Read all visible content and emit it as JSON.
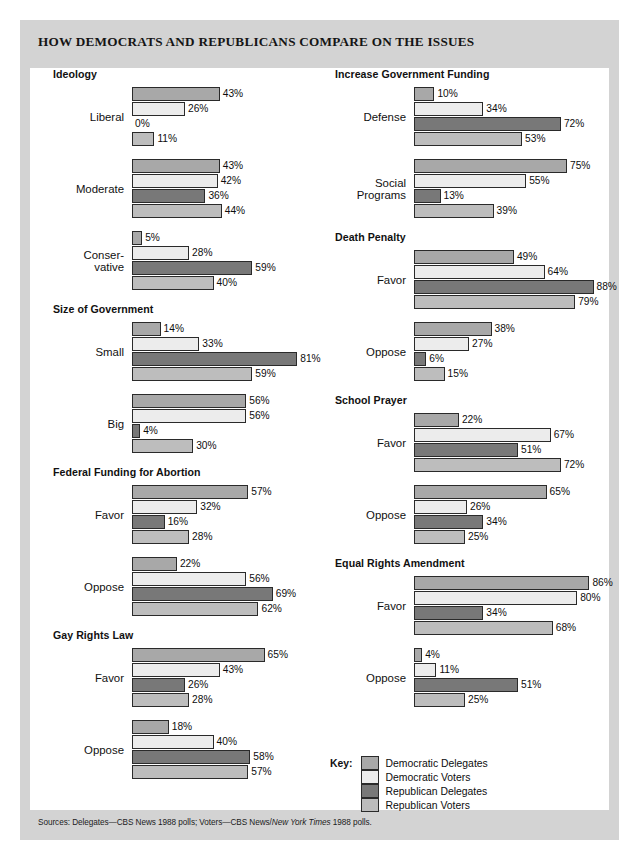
{
  "title": "HOW DEMOCRATS AND REPUBLICANS COMPARE ON THE ISSUES",
  "source_prefix": "Sources: Delegates—CBS News 1988 polls; Voters—CBS News/",
  "source_italic": "New York Times",
  "source_suffix": " 1988 polls.",
  "legend": {
    "title": "Key:",
    "entries": [
      {
        "label": "Democratic Delegates",
        "color": "#a8a8a8"
      },
      {
        "label": "Democratic Voters",
        "color": "#ececec"
      },
      {
        "label": "Republican Delegates",
        "color": "#787878"
      },
      {
        "label": "Republican Voters",
        "color": "#bdbdbd"
      }
    ]
  },
  "chart_data": {
    "type": "bar",
    "orientation": "horizontal",
    "title": "HOW DEMOCRATS AND REPUBLICANS COMPARE ON THE ISSUES",
    "xlabel": "",
    "ylabel": "",
    "xlim": [
      0,
      100
    ],
    "unit": "%",
    "grid": false,
    "legend_position": "bottom-right",
    "series_names": [
      "Democratic Delegates",
      "Democratic Voters",
      "Republican Delegates",
      "Republican Voters"
    ],
    "series_colors": [
      "#a8a8a8",
      "#ececec",
      "#787878",
      "#bdbdbd"
    ],
    "sections": [
      {
        "title": "Ideology",
        "column": "left",
        "groups": [
          {
            "label": "Liberal",
            "values": [
              43,
              26,
              0,
              11
            ]
          },
          {
            "label": "Moderate",
            "values": [
              43,
              42,
              36,
              44
            ]
          },
          {
            "label": "Conser-\nvative",
            "values": [
              5,
              28,
              59,
              40
            ]
          }
        ]
      },
      {
        "title": "Size of Government",
        "column": "left",
        "groups": [
          {
            "label": "Small",
            "values": [
              14,
              33,
              81,
              59
            ]
          },
          {
            "label": "Big",
            "values": [
              56,
              56,
              4,
              30
            ]
          }
        ]
      },
      {
        "title": "Federal Funding for Abortion",
        "column": "left",
        "groups": [
          {
            "label": "Favor",
            "values": [
              57,
              32,
              16,
              28
            ]
          },
          {
            "label": "Oppose",
            "values": [
              22,
              56,
              69,
              62
            ]
          }
        ]
      },
      {
        "title": "Gay Rights Law",
        "column": "left",
        "groups": [
          {
            "label": "Favor",
            "values": [
              65,
              43,
              26,
              28
            ]
          },
          {
            "label": "Oppose",
            "values": [
              18,
              40,
              58,
              57
            ]
          }
        ]
      },
      {
        "title": "Increase Government Funding",
        "column": "right",
        "groups": [
          {
            "label": "Defense",
            "values": [
              10,
              34,
              72,
              53
            ]
          },
          {
            "label": "Social\nPrograms",
            "values": [
              75,
              55,
              13,
              39
            ]
          }
        ]
      },
      {
        "title": "Death Penalty",
        "column": "right",
        "groups": [
          {
            "label": "Favor",
            "values": [
              49,
              64,
              88,
              79
            ]
          },
          {
            "label": "Oppose",
            "values": [
              38,
              27,
              6,
              15
            ]
          }
        ]
      },
      {
        "title": "School Prayer",
        "column": "right",
        "groups": [
          {
            "label": "Favor",
            "values": [
              22,
              67,
              51,
              72
            ]
          },
          {
            "label": "Oppose",
            "values": [
              65,
              26,
              34,
              25
            ]
          }
        ]
      },
      {
        "title": "Equal Rights Amendment",
        "column": "right",
        "groups": [
          {
            "label": "Favor",
            "values": [
              86,
              80,
              34,
              68
            ]
          },
          {
            "label": "Oppose",
            "values": [
              4,
              11,
              51,
              25
            ]
          }
        ]
      }
    ]
  }
}
